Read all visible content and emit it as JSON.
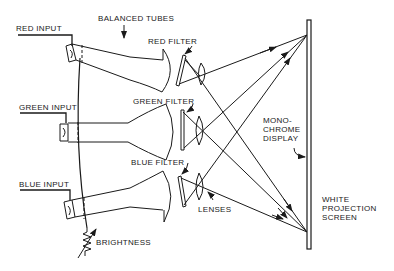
{
  "diagram": {
    "labels": {
      "red_input": "RED INPUT",
      "green_input": "GREEN INPUT",
      "blue_input": "BLUE INPUT",
      "balanced_tubes": "BALANCED TUBES",
      "red_filter": "RED FILTER",
      "green_filter": "GREEN FILTER",
      "blue_filter": "BLUE FILTER",
      "lenses": "LENSES",
      "brightness": "BRIGHTNESS",
      "monochrome_display": "MONO-\nCHROME\nDISPLAY",
      "white_projection_screen": "WHITE\nPROJECTION\nSCREEN"
    },
    "components": [
      {
        "name": "red-tube",
        "input": "RED INPUT",
        "filter": "RED FILTER"
      },
      {
        "name": "green-tube",
        "input": "GREEN INPUT",
        "filter": "GREEN FILTER"
      },
      {
        "name": "blue-tube",
        "input": "BLUE INPUT",
        "filter": "BLUE FILTER"
      }
    ],
    "colors": {
      "line": "#1a1a1a",
      "background": "#ffffff"
    }
  }
}
